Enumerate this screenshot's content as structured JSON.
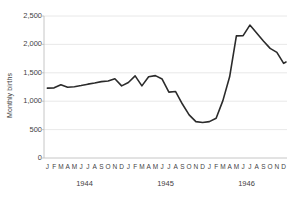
{
  "chart_data": {
    "type": "line",
    "title": "",
    "xlabel": "",
    "ylabel": "Monthly births",
    "ylim": [
      0,
      2500
    ],
    "yticks": [
      0,
      500,
      1000,
      1500,
      2000,
      2500
    ],
    "ytick_labels": [
      "0",
      "500",
      "1,000",
      "1,500",
      "2,000",
      "2,500"
    ],
    "grid": true,
    "legend": "none",
    "line_color": "#2b2b2b",
    "grid_color": "#e2e2e2",
    "axis_color": "#bfbfbf",
    "months": [
      "J",
      "F",
      "M",
      "A",
      "M",
      "J",
      "J",
      "A",
      "S",
      "O",
      "N",
      "D"
    ],
    "year_groups": [
      {
        "label": "1944",
        "months": [
          "J",
          "F",
          "M",
          "A",
          "M",
          "J",
          "J",
          "A",
          "S",
          "O",
          "N",
          "D"
        ]
      },
      {
        "label": "1945",
        "months": [
          "J",
          "F",
          "M",
          "A",
          "M",
          "J",
          "J",
          "A",
          "S",
          "O",
          "N",
          "D"
        ]
      },
      {
        "label": "1946",
        "months": [
          "J",
          "F",
          "M",
          "A",
          "M",
          "J",
          "J",
          "A",
          "S",
          "O",
          "N",
          "D"
        ]
      }
    ],
    "categories": [
      "1944-J",
      "1944-F",
      "1944-M",
      "1944-A",
      "1944-M",
      "1944-J",
      "1944-J",
      "1944-A",
      "1944-S",
      "1944-O",
      "1944-N",
      "1944-D",
      "1945-J",
      "1945-F",
      "1945-M",
      "1945-A",
      "1945-M",
      "1945-J",
      "1945-J",
      "1945-A",
      "1945-S",
      "1945-O",
      "1945-N",
      "1945-D",
      "1946-J",
      "1946-F",
      "1946-M",
      "1946-A",
      "1946-M",
      "1946-J",
      "1946-J",
      "1946-A",
      "1946-S",
      "1946-O",
      "1946-N",
      "1946-D"
    ],
    "values": [
      1230,
      1235,
      1290,
      1245,
      1255,
      1275,
      1300,
      1320,
      1345,
      1355,
      1395,
      1270,
      1330,
      1445,
      1270,
      1430,
      1450,
      1390,
      1160,
      1170,
      950,
      760,
      640,
      625,
      640,
      700,
      1010,
      1430,
      2150,
      2155,
      2340,
      2200,
      2060,
      1930,
      1860,
      1665
    ],
    "last_point_value": 1690,
    "series_name": "Monthly births"
  }
}
